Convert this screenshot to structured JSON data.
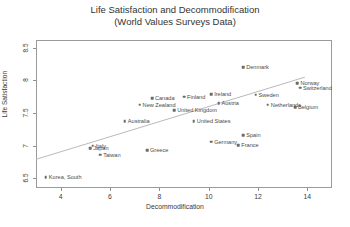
{
  "chart_data": {
    "type": "scatter",
    "title": "Life Satisfaction and Decommodification",
    "subtitle": "(World Values Surveys Data)",
    "xlabel": "Decommodification",
    "ylabel": "Life Satisfaction",
    "xlim": [
      3.0,
      15.0
    ],
    "ylim": [
      6.35,
      8.62
    ],
    "xticks": [
      4,
      6,
      8,
      10,
      12,
      14
    ],
    "yticks": [
      6.5,
      7,
      7.5,
      8,
      8.5
    ],
    "grid": false,
    "legend": false,
    "point_color": "#6b6b6b",
    "trendline": {
      "visible": true,
      "color": "#b9b9b9",
      "x_start": 3.0,
      "y_start": 6.79,
      "x_end": 13.9,
      "y_end": 8.05
    },
    "points": [
      {
        "label": "Denmark",
        "x": 11.4,
        "y": 8.2
      },
      {
        "label": "Norway",
        "x": 13.6,
        "y": 7.96
      },
      {
        "label": "Switzerland",
        "x": 13.7,
        "y": 7.89
      },
      {
        "label": "Sweden",
        "x": 11.9,
        "y": 7.78
      },
      {
        "label": "Belgium",
        "x": 13.5,
        "y": 7.59
      },
      {
        "label": "Netherlands",
        "x": 12.4,
        "y": 7.63
      },
      {
        "label": "Ireland",
        "x": 10.1,
        "y": 7.79
      },
      {
        "label": "Finland",
        "x": 9.0,
        "y": 7.75
      },
      {
        "label": "Canada",
        "x": 7.7,
        "y": 7.73
      },
      {
        "label": "Austria",
        "x": 10.4,
        "y": 7.65
      },
      {
        "label": "New Zealand",
        "x": 7.2,
        "y": 7.63
      },
      {
        "label": "United Kingdom",
        "x": 8.6,
        "y": 7.54
      },
      {
        "label": "Australia",
        "x": 6.6,
        "y": 7.37
      },
      {
        "label": "United States",
        "x": 9.4,
        "y": 7.37
      },
      {
        "label": "Spain",
        "x": 11.4,
        "y": 7.16
      },
      {
        "label": "Germany",
        "x": 10.1,
        "y": 7.06
      },
      {
        "label": "France",
        "x": 11.2,
        "y": 7.01
      },
      {
        "label": "Greece",
        "x": 7.5,
        "y": 6.93
      },
      {
        "label": "Italy",
        "x": 5.3,
        "y": 7.0
      },
      {
        "label": "Japan",
        "x": 5.2,
        "y": 6.96
      },
      {
        "label": "Taiwan",
        "x": 5.6,
        "y": 6.86
      },
      {
        "label": "Korea, South",
        "x": 3.4,
        "y": 6.52
      }
    ]
  }
}
